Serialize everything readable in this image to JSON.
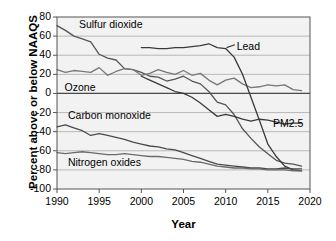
{
  "chart_data": {
    "type": "line",
    "title": "",
    "xlabel": "Year",
    "ylabel": "Percent above or below NAAQS",
    "xlim": [
      1990,
      2020
    ],
    "ylim": [
      -100,
      80
    ],
    "xticks": [
      1990,
      1995,
      2000,
      2005,
      2010,
      2015,
      2020
    ],
    "yticks": [
      80,
      60,
      40,
      20,
      0,
      -20,
      -40,
      -60,
      -80,
      -100
    ],
    "grid": true,
    "legend_position": "inline-annotations",
    "x": [
      1990,
      1991,
      1992,
      1993,
      1994,
      1995,
      1996,
      1997,
      1998,
      1999,
      2000,
      2001,
      2002,
      2003,
      2004,
      2005,
      2006,
      2007,
      2008,
      2009,
      2010,
      2011,
      2012,
      2013,
      2014,
      2015,
      2016,
      2017,
      2018,
      2019
    ],
    "series": [
      {
        "name": "Sulfur dioxide",
        "color": "#555555",
        "label_x": 1992.6,
        "label_y": 72,
        "values": [
          71,
          66,
          60,
          57,
          54,
          41,
          37,
          35,
          26,
          25,
          22,
          18,
          17,
          13,
          15,
          18,
          13,
          10,
          2,
          -9,
          -12,
          -22,
          -37,
          -47,
          -56,
          -63,
          -70,
          -73,
          -74,
          -76
        ]
      },
      {
        "name": "Ozone",
        "color": "#777777",
        "label_x": 1990.9,
        "label_y": 6,
        "values": [
          25,
          22,
          24,
          23,
          22,
          27,
          19,
          23,
          26,
          25,
          19,
          21,
          25,
          22,
          20,
          24,
          19,
          21,
          14,
          9,
          14,
          16,
          10,
          6,
          7,
          9,
          8,
          9,
          4,
          3
        ]
      },
      {
        "name": "Lead",
        "color": "#3a3a3a",
        "label_x": 2011.3,
        "label_y": 49,
        "values": [
          null,
          null,
          null,
          null,
          null,
          null,
          null,
          null,
          null,
          null,
          48,
          48,
          47,
          47,
          48,
          48,
          49,
          50,
          52,
          48,
          47,
          38,
          20,
          -4,
          -28,
          -53,
          -66,
          -76,
          -80,
          -81
        ]
      },
      {
        "name": "PM2.5",
        "color": "#3a3a3a",
        "label_x": 2015.6,
        "label_y": -32,
        "values": [
          null,
          null,
          null,
          null,
          null,
          null,
          null,
          null,
          null,
          null,
          18,
          14,
          10,
          6,
          2,
          0,
          -4,
          -10,
          -17,
          -24,
          -22,
          -24,
          -27,
          -29,
          -27,
          -28,
          -30,
          -32,
          -31,
          -31
        ]
      },
      {
        "name": "Carbon monoxide",
        "color": "#4a4a4a",
        "label_x": 1991.3,
        "label_y": -24,
        "values": [
          -35,
          -33,
          -36,
          -39,
          -44,
          -42,
          -44,
          -46,
          -48,
          -51,
          -53,
          -55,
          -56,
          -58,
          -59,
          -62,
          -65,
          -68,
          -71,
          -74,
          -75,
          -76,
          -77,
          -78,
          -78,
          -79,
          -79,
          -78,
          -79,
          -79
        ]
      },
      {
        "name": "Nitrogen oxides",
        "color": "#6a6a6a",
        "label_x": 1991.3,
        "label_y": -73,
        "values": [
          -62,
          -63,
          -62,
          -61,
          -62,
          -63,
          -64,
          -64,
          -63,
          -64,
          -65,
          -66,
          -66,
          -67,
          -68,
          -69,
          -71,
          -72,
          -74,
          -76,
          -77,
          -78,
          -78,
          -79,
          -79,
          -80,
          -80,
          -80,
          -81,
          -81
        ]
      }
    ],
    "annotations": [
      {
        "name": "lead-leader-line",
        "from_x": 2010.1,
        "from_y": 48,
        "to_x": 2011.1,
        "to_y": 51
      }
    ]
  },
  "axes": {
    "xtick_labels": [
      "1990",
      "1995",
      "2000",
      "2005",
      "2010",
      "2015",
      "2020"
    ],
    "ytick_labels": [
      "80",
      "60",
      "40",
      "20",
      "0",
      "-20",
      "-40",
      "-60",
      "-80",
      "-100"
    ],
    "x_title": "Year",
    "y_title": "Percent above or below NAAQS"
  },
  "style": {
    "plot_bg": "#f2f2f2",
    "grid_color": "#b8b8b8",
    "axis_color": "#555555",
    "zero_line_color": "#4a4a4a",
    "text_color": "#000000"
  }
}
